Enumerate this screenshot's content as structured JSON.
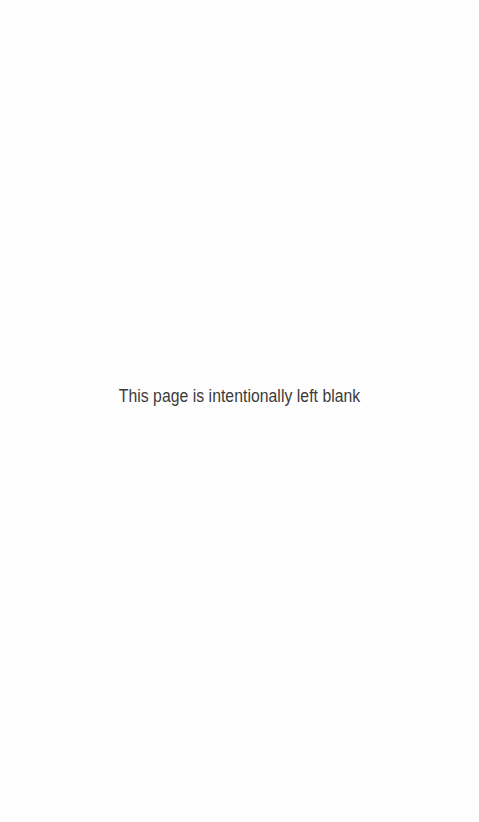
{
  "page": {
    "kind": "blank-page-placeholder",
    "width": 479,
    "height": 822,
    "background_color": "#fefefe"
  },
  "notice": {
    "text": "This page is intentionally left blank",
    "color": "#3a3a3a",
    "font_size_px": 17.5,
    "align": "center"
  }
}
